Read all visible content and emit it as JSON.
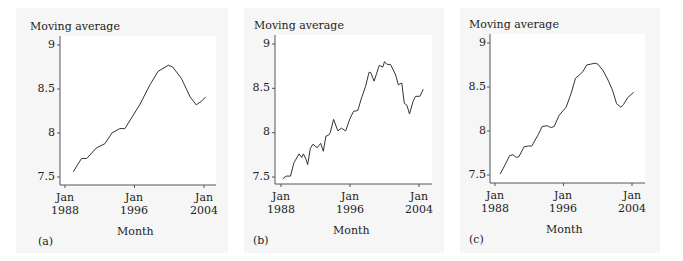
{
  "chart_data": [
    {
      "type": "line",
      "panel": "(a)",
      "title": "",
      "ylabel": "Moving average",
      "xlabel": "Month",
      "ylim": [
        7.45,
        9.05
      ],
      "yticks": [
        7.5,
        8,
        8.5,
        9
      ],
      "ytick_labels": [
        "7.5",
        "8",
        "8.5",
        "9"
      ],
      "xticks": [
        1988,
        1996,
        2004
      ],
      "xtick_labels": [
        "Jan\n1988",
        "Jan\n1996",
        "Jan\n2004"
      ],
      "grid": false,
      "x": [
        1988.95,
        1989.9,
        1990.5,
        1991.6,
        1992.6,
        1993.4,
        1994.3,
        1994.9,
        1996.6,
        1997.8,
        1998.7,
        1999.9,
        2000.4,
        2001.4,
        2002.4,
        2003.1,
        2003.7,
        2004.2
      ],
      "series": [
        {
          "name": "Moving average",
          "values": [
            7.56,
            7.71,
            7.71,
            7.83,
            7.88,
            8.0,
            8.05,
            8.05,
            8.32,
            8.55,
            8.7,
            8.77,
            8.75,
            8.62,
            8.41,
            8.32,
            8.36,
            8.41
          ]
        }
      ]
    },
    {
      "type": "line",
      "panel": "(b)",
      "title": "",
      "ylabel": "Moving average",
      "xlabel": "Month",
      "ylim": [
        7.45,
        9.05
      ],
      "yticks": [
        7.5,
        8,
        8.5,
        9
      ],
      "ytick_labels": [
        "7.5",
        "8",
        "8.5",
        "9"
      ],
      "xticks": [
        1988,
        1996,
        2004
      ],
      "xtick_labels": [
        "Jan\n1988",
        "Jan\n1996",
        "Jan\n2004"
      ],
      "grid": false,
      "x": [
        1988.2,
        1988.6,
        1989.1,
        1989.5,
        1990.1,
        1990.4,
        1990.6,
        1990.9,
        1991.1,
        1991.4,
        1991.7,
        1992.2,
        1992.6,
        1992.9,
        1993.2,
        1993.5,
        1993.7,
        1994.1,
        1994.6,
        1995.0,
        1995.5,
        1996.0,
        1996.4,
        1996.9,
        1997.3,
        1997.8,
        1998.2,
        1998.4,
        1998.8,
        1999.4,
        1999.8,
        2000.0,
        2000.3,
        2000.7,
        2001.3,
        2001.6,
        2002.0,
        2002.3,
        2002.6,
        2002.9,
        2003.3,
        2003.6,
        2004.1,
        2004.5
      ],
      "series": [
        {
          "name": "Moving average",
          "values": [
            7.48,
            7.51,
            7.51,
            7.66,
            7.76,
            7.72,
            7.76,
            7.7,
            7.64,
            7.82,
            7.87,
            7.83,
            7.88,
            7.79,
            7.96,
            7.97,
            8.0,
            8.15,
            8.02,
            8.05,
            8.02,
            8.16,
            8.24,
            8.25,
            8.38,
            8.52,
            8.68,
            8.68,
            8.58,
            8.76,
            8.74,
            8.8,
            8.77,
            8.77,
            8.65,
            8.54,
            8.56,
            8.33,
            8.31,
            8.21,
            8.35,
            8.41,
            8.41,
            8.49
          ]
        }
      ]
    },
    {
      "type": "line",
      "panel": "(c)",
      "title": "",
      "ylabel": "Moving average",
      "xlabel": "Month",
      "ylim": [
        7.45,
        9.05
      ],
      "yticks": [
        7.5,
        8,
        8.5,
        9
      ],
      "ytick_labels": [
        "7.5",
        "8",
        "8.5",
        "9"
      ],
      "xticks": [
        1988,
        1996,
        2004
      ],
      "xtick_labels": [
        "Jan\n1988",
        "Jan\n1996",
        "Jan\n2004"
      ],
      "grid": false,
      "x": [
        1988.6,
        1989.2,
        1989.7,
        1990.1,
        1990.5,
        1990.8,
        1991.4,
        1991.9,
        1992.3,
        1993.0,
        1993.5,
        1994.1,
        1994.5,
        1994.9,
        1995.5,
        1996.3,
        1996.9,
        1997.4,
        1997.9,
        1998.3,
        1998.7,
        1999.2,
        1999.7,
        2000.0,
        2000.6,
        2001.2,
        2001.7,
        2002.2,
        2002.7,
        2003.0,
        2003.5,
        2004.2
      ],
      "series": [
        {
          "name": "Moving average",
          "values": [
            7.51,
            7.62,
            7.72,
            7.73,
            7.7,
            7.71,
            7.82,
            7.83,
            7.83,
            7.95,
            8.05,
            8.06,
            8.04,
            8.05,
            8.18,
            8.27,
            8.43,
            8.6,
            8.64,
            8.68,
            8.75,
            8.76,
            8.77,
            8.76,
            8.69,
            8.58,
            8.47,
            8.31,
            8.27,
            8.3,
            8.38,
            8.44
          ]
        }
      ]
    }
  ],
  "panels": [
    {
      "ylabel": "Moving average",
      "xlabel": "Month",
      "label": "(a)",
      "yticks": [
        "9",
        "8.5",
        "8",
        "7.5"
      ],
      "xticks": [
        {
          "line1": "Jan",
          "line2": "1988"
        },
        {
          "line1": "Jan",
          "line2": "1996"
        },
        {
          "line1": "Jan",
          "line2": "2004"
        }
      ]
    },
    {
      "ylabel": "Moving average",
      "xlabel": "Month",
      "label": "(b)",
      "yticks": [
        "9",
        "8.5",
        "8",
        "7.5"
      ],
      "xticks": [
        {
          "line1": "Jan",
          "line2": "1988"
        },
        {
          "line1": "Jan",
          "line2": "1996"
        },
        {
          "line1": "Jan",
          "line2": "2004"
        }
      ]
    },
    {
      "ylabel": "Moving average",
      "xlabel": "Month",
      "label": "(c)",
      "yticks": [
        "9",
        "8.5",
        "8",
        "7.5"
      ],
      "xticks": [
        {
          "line1": "Jan",
          "line2": "1988"
        },
        {
          "line1": "Jan",
          "line2": "1996"
        },
        {
          "line1": "Jan",
          "line2": "2004"
        }
      ]
    }
  ],
  "colors": {
    "line": "#333333",
    "axis": "#555555",
    "panel_bg": "#f6f6f6",
    "plot_bg": "#ffffff"
  }
}
